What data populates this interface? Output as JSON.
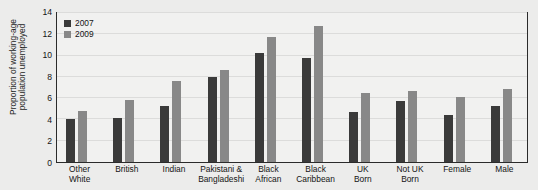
{
  "chart_data": {
    "type": "bar",
    "title": "",
    "subtitle": "",
    "xlabel": "",
    "ylabel": "Proportion of working-age population unemployed",
    "ylabel_lines": [
      "Proportion of working-age",
      "population unemployed"
    ],
    "ylim": [
      0,
      14
    ],
    "ytick_step": 2,
    "yticks": [
      0,
      2,
      4,
      6,
      8,
      10,
      12,
      14
    ],
    "ytick_labels": [
      "0",
      "2",
      "4",
      "6",
      "8",
      "10",
      "12",
      "14"
    ],
    "grid": true,
    "grid_orientation": "horizontal",
    "legend_position": "top-left",
    "categories": [
      "Other White",
      "British",
      "Indian",
      "Pakistani & Bangladeshi",
      "Black African",
      "Black Caribbean",
      "UK Born",
      "Not UK Born",
      "Female",
      "Male"
    ],
    "category_label_lines": [
      [
        "Other",
        "White"
      ],
      [
        "British"
      ],
      [
        "Indian"
      ],
      [
        "Pakistani &",
        "Bangladeshi"
      ],
      [
        "Black",
        "African"
      ],
      [
        "Black",
        "Caribbean"
      ],
      [
        "UK",
        "Born"
      ],
      [
        "Not UK",
        "Born"
      ],
      [
        "Female"
      ],
      [
        "Male"
      ]
    ],
    "series": [
      {
        "name": "2007",
        "color": "#3a3a3a",
        "values": [
          4.0,
          4.1,
          5.3,
          8.0,
          10.2,
          9.8,
          4.7,
          5.7,
          4.4,
          5.3
        ]
      },
      {
        "name": "2009",
        "color": "#888888",
        "values": [
          4.8,
          5.8,
          7.6,
          8.6,
          11.7,
          12.8,
          6.5,
          6.7,
          6.1,
          6.9
        ]
      }
    ]
  },
  "legend": {
    "items": [
      {
        "label": "2007",
        "color": "#3a3a3a"
      },
      {
        "label": "2009",
        "color": "#888888"
      }
    ]
  },
  "colors": {
    "series_2007": "#3a3a3a",
    "series_2009": "#888888",
    "page_background": "#ececeb",
    "plot_background": "#f1f1f0",
    "axis_border": "#2b2b2b",
    "gridline": "#dcdcdb",
    "text": "#141414"
  }
}
